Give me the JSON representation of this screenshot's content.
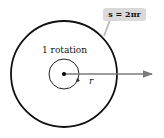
{
  "diagram": {
    "formula_label": "s = 2πr",
    "rotation_label": "1 rotation",
    "radius_label": "r",
    "colors": {
      "outer_circle": "#111111",
      "inner_circle": "#222222",
      "arrow": "#7a7a7a",
      "label_box": "#d9d9d9",
      "pointer": "#bdbdbd"
    }
  }
}
